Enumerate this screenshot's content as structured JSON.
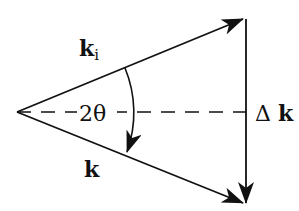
{
  "diagram": {
    "type": "vector-triangle",
    "labels": {
      "incident_vector": "k",
      "incident_subscript": "i",
      "scattered_vector": "k",
      "angle": "2θ",
      "momentum_transfer": "Δk"
    },
    "geometry": {
      "apex": [
        17,
        112
      ],
      "incident_tip": [
        243,
        19
      ],
      "scattered_tip": [
        243,
        203
      ],
      "delta_k_top": [
        246,
        19
      ],
      "delta_k_bottom": [
        246,
        203
      ],
      "bisector_end": [
        246,
        112
      ],
      "arc_radius": 115
    },
    "colors": {
      "stroke": "#111111",
      "background": "#ffffff"
    }
  }
}
